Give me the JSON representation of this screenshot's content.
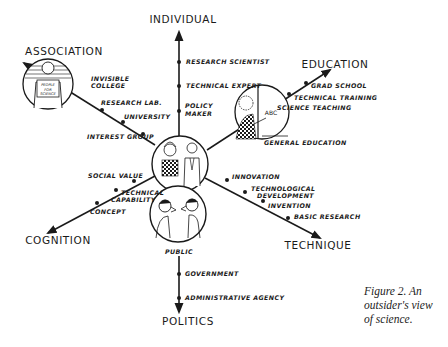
{
  "figure": {
    "caption_lines": [
      "Figure 2. An",
      "outsider's view",
      "of science."
    ]
  },
  "axes": {
    "individual": {
      "label": "INDIVIDUAL",
      "nodes": [
        "RESEARCH SCIENTIST",
        "TECHNICAL EXPERT",
        "POLICY",
        "MAKER"
      ]
    },
    "education": {
      "label": "EDUCATION",
      "nodes": [
        "GRAD SCHOOL",
        "TECHNICAL TRAINING",
        "SCIENCE TEACHING",
        "GENERAL EDUCATION"
      ]
    },
    "technique": {
      "label": "TECHNIQUE",
      "nodes": [
        "INNOVATION",
        "TECHNOLOGICAL",
        "DEVELOPMENT",
        "INVENTION",
        "BASIC RESEARCH"
      ]
    },
    "politics": {
      "label": "POLITICS",
      "nodes": [
        "PUBLIC",
        "GOVERNMENT",
        "ADMINISTRATIVE AGENCY"
      ]
    },
    "cognition": {
      "label": "COGNITION",
      "nodes": [
        "SOCIAL VALUE",
        "TECHNICAL",
        "CAPABILITY",
        "CONCEPT"
      ]
    },
    "association": {
      "label": "ASSOCIATION",
      "nodes": [
        "INVISIBLE",
        "COLLEGE",
        "RESEARCH LAB.",
        "UNIVERSITY",
        "INTEREST GROUP"
      ]
    }
  },
  "illustrations": {
    "association_sign": [
      "PEOPLE",
      "FOR",
      "SCIENCE"
    ],
    "blackboard_text": "ABC"
  },
  "colors": {
    "ink": "#1a1a1a",
    "background": "#ffffff"
  }
}
